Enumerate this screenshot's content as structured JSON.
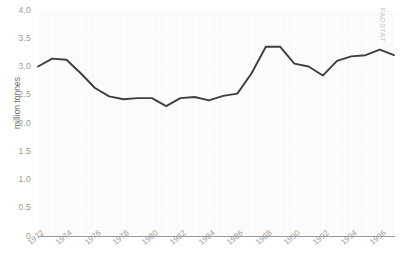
{
  "watermark": "FAOSTAT",
  "chart_data": {
    "type": "line",
    "title": "",
    "xlabel": "",
    "ylabel": "million tonnes",
    "ylim": [
      0,
      4.0
    ],
    "xlim": [
      1972,
      1997
    ],
    "grid": true,
    "legend": "none",
    "line_color": "#3f3f3f",
    "background_color": "#fbfbfb",
    "grid_color": "#ffffff",
    "axis_color": "#9b9b9b",
    "tick_text_color": "#9a9a9a",
    "y_ticks": [
      "0",
      "0.5",
      "1.0",
      "1.5",
      "2.0",
      "2.5",
      "3.0",
      "3.5",
      "4.0"
    ],
    "y_tick_values": [
      0,
      0.5,
      1.0,
      1.5,
      2.0,
      2.5,
      3.0,
      3.5,
      4.0
    ],
    "x_ticks": [
      "1972",
      "1974",
      "1976",
      "1978",
      "1980",
      "1982",
      "1984",
      "1986",
      "1988",
      "1990",
      "1992",
      "1994",
      "1996"
    ],
    "x_tick_values": [
      1972,
      1974,
      1976,
      1978,
      1980,
      1982,
      1984,
      1986,
      1988,
      1990,
      1992,
      1994,
      1996
    ],
    "x": [
      1972,
      1973,
      1974,
      1975,
      1976,
      1977,
      1978,
      1979,
      1980,
      1981,
      1982,
      1983,
      1984,
      1985,
      1986,
      1987,
      1988,
      1989,
      1990,
      1991,
      1992,
      1993,
      1994,
      1995,
      1996,
      1997
    ],
    "values": [
      3.0,
      3.14,
      3.12,
      2.88,
      2.62,
      2.47,
      2.42,
      2.44,
      2.44,
      2.3,
      2.44,
      2.46,
      2.4,
      2.48,
      2.52,
      2.88,
      3.35,
      3.35,
      3.05,
      3.0,
      2.84,
      3.1,
      3.18,
      3.2,
      3.3,
      3.2
    ],
    "series": [
      {
        "name": "million tonnes",
        "values": [
          3.0,
          3.14,
          3.12,
          2.88,
          2.62,
          2.47,
          2.42,
          2.44,
          2.44,
          2.3,
          2.44,
          2.46,
          2.4,
          2.48,
          2.52,
          2.88,
          3.35,
          3.35,
          3.05,
          3.0,
          2.84,
          3.1,
          3.18,
          3.2,
          3.3,
          3.2
        ]
      }
    ]
  }
}
